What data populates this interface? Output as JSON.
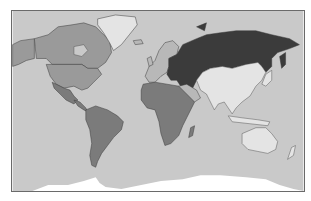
{
  "map": {
    "type": "choropleth-world",
    "projection": "mercator-like",
    "palette": {
      "ocean": "#c9c9c9",
      "very_dark": "#3b3b3b",
      "dark": "#7b7b7b",
      "medium": "#9a9a9a",
      "light": "#b8b8b8",
      "none": "#e4e4e4",
      "ice": "#ffffff",
      "border": "#3a3a3a"
    },
    "regions": [
      {
        "name": "Russia / Central Asia / Turkey / Iran",
        "shade": "very_dark"
      },
      {
        "name": "North America (Canada, USA, Mexico)",
        "shade": "medium"
      },
      {
        "name": "Central America",
        "shade": "dark"
      },
      {
        "name": "South America",
        "shade": "dark"
      },
      {
        "name": "Africa",
        "shade": "dark"
      },
      {
        "name": "Europe",
        "shade": "light"
      },
      {
        "name": "Greenland",
        "shade": "none"
      },
      {
        "name": "East & South Asia",
        "shade": "none"
      },
      {
        "name": "Australia / Oceania",
        "shade": "none"
      },
      {
        "name": "Antarctica",
        "shade": "ice"
      }
    ]
  }
}
